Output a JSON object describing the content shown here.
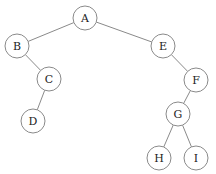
{
  "diagram": {
    "type": "binary-tree",
    "node_radius": 12,
    "colors": {
      "stroke": "#8a8a8a",
      "text": "#222222",
      "background": "#ffffff"
    },
    "nodes": [
      {
        "id": "A",
        "label": "A",
        "x": 85,
        "y": 18
      },
      {
        "id": "B",
        "label": "B",
        "x": 17,
        "y": 46
      },
      {
        "id": "C",
        "label": "C",
        "x": 49,
        "y": 79
      },
      {
        "id": "D",
        "label": "D",
        "x": 33,
        "y": 121
      },
      {
        "id": "E",
        "label": "E",
        "x": 163,
        "y": 46
      },
      {
        "id": "F",
        "label": "F",
        "x": 196,
        "y": 80
      },
      {
        "id": "G",
        "label": "G",
        "x": 178,
        "y": 114
      },
      {
        "id": "H",
        "label": "H",
        "x": 159,
        "y": 158
      },
      {
        "id": "I",
        "label": "I",
        "x": 196,
        "y": 158
      }
    ],
    "edges": [
      {
        "from": "A",
        "to": "B"
      },
      {
        "from": "A",
        "to": "E"
      },
      {
        "from": "B",
        "to": "C"
      },
      {
        "from": "C",
        "to": "D"
      },
      {
        "from": "E",
        "to": "F"
      },
      {
        "from": "F",
        "to": "G"
      },
      {
        "from": "G",
        "to": "H"
      },
      {
        "from": "G",
        "to": "I"
      }
    ]
  }
}
